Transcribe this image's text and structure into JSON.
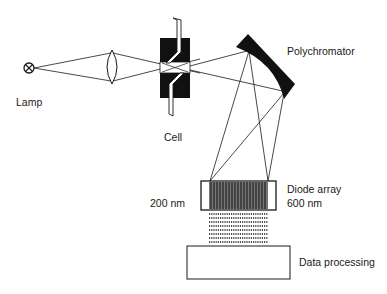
{
  "labels": {
    "lamp": "Lamp",
    "cell": "Cell",
    "polychromator": "Polychromator",
    "diode_array": "Diode array",
    "wavelength_min": "200 nm",
    "wavelength_max": "600 nm",
    "data_processing": "Data processing"
  },
  "components": [
    {
      "id": "lamp",
      "type": "light-source"
    },
    {
      "id": "lens",
      "type": "converging-lens"
    },
    {
      "id": "cell",
      "type": "flow-cell"
    },
    {
      "id": "polychromator",
      "type": "concave-grating"
    },
    {
      "id": "diode_array",
      "type": "detector",
      "range": [
        "200 nm",
        "600 nm"
      ]
    },
    {
      "id": "data_processing",
      "type": "processor"
    }
  ],
  "connections": [
    {
      "from": "lamp",
      "to": "lens"
    },
    {
      "from": "lens",
      "to": "cell"
    },
    {
      "from": "cell",
      "to": "polychromator"
    },
    {
      "from": "polychromator",
      "to": "diode_array"
    },
    {
      "from": "diode_array",
      "to": "data_processing"
    }
  ],
  "colors": {
    "ink": "#1a1a1a",
    "background": "#ffffff"
  }
}
